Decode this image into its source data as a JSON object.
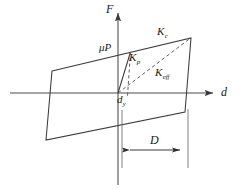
{
  "figure": {
    "type": "hysteresis-loop-diagram",
    "axes": {
      "y_label": "F",
      "x_label": "d",
      "origin": {
        "x": 118,
        "y": 93
      }
    },
    "labels": {
      "mu_p": {
        "base": "μP",
        "sub": ""
      },
      "k_c": {
        "base": "K",
        "sub": "c"
      },
      "k_p": {
        "base": "K",
        "sub": "p"
      },
      "k_eff": {
        "base": "K",
        "sub": "eff"
      },
      "d_y": {
        "base": "d",
        "sub": "y"
      },
      "dimension_D": {
        "base": "D",
        "sub": ""
      }
    },
    "colors": {
      "stroke": "#3a3a3a",
      "axis": "#4a4a4a",
      "dashed": "#5a5a5a",
      "background": "#ffffff",
      "text": "#1a1a1a"
    },
    "geometry": {
      "loop_polygon": [
        [
          52,
          71
        ],
        [
          191,
          38
        ],
        [
          185,
          112
        ],
        [
          46,
          140
        ]
      ],
      "post_yield_segment": [
        [
          118,
          93
        ],
        [
          130,
          52
        ]
      ],
      "yield_drop_dashed": [
        [
          130,
          52
        ],
        [
          130,
          95
        ]
      ],
      "k_eff_dashed": [
        [
          118,
          93
        ],
        [
          191,
          38
        ]
      ],
      "x_axis": [
        [
          10,
          93
        ],
        [
          216,
          93
        ]
      ],
      "y_axis": [
        [
          118,
          185
        ],
        [
          118,
          10
        ]
      ],
      "dimension_line_y": 150,
      "dimension_from_x": 122,
      "dimension_to_x": 186,
      "extension_left": [
        [
          122,
          112
        ],
        [
          122,
          166
        ]
      ],
      "extension_right": [
        [
          188,
          112
        ],
        [
          188,
          166
        ]
      ]
    }
  }
}
